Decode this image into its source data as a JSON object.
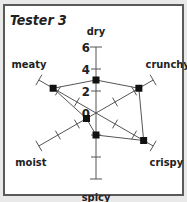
{
  "chart_data": {
    "type": "radar",
    "title": "Tester 3",
    "axes": [
      "dry",
      "crunchy",
      "crispy",
      "spicy",
      "moist",
      "meaty"
    ],
    "values": [
      3,
      4.5,
      5,
      2,
      1,
      4.5
    ],
    "scale": {
      "min": 0,
      "max": 6,
      "tick_labels": [
        "0",
        "2",
        "4",
        "6"
      ]
    },
    "grid": false,
    "legend": null
  },
  "colors": {
    "line": "#555555",
    "marker": "#111111",
    "frame": "#5a5a5a",
    "background": "#ffffff"
  }
}
